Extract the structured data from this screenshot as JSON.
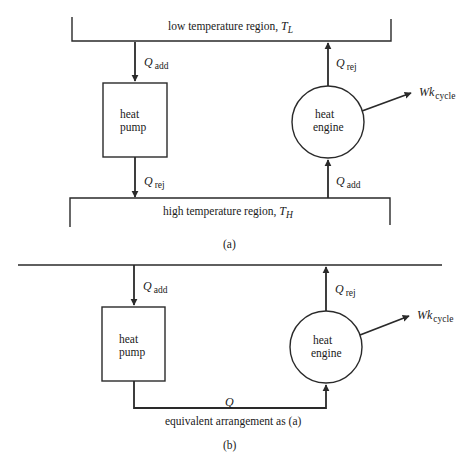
{
  "figure_a": {
    "low_region": {
      "text": "low temperature region, ",
      "symbol": "T",
      "subscript": "L"
    },
    "high_region": {
      "text": "high temperature region, ",
      "symbol": "T",
      "subscript": "H"
    },
    "heat_pump": {
      "line1": "heat",
      "line2": "pump"
    },
    "heat_engine": {
      "line1": "heat",
      "line2": "engine"
    },
    "pump_in": {
      "symbol": "Q",
      "subscript": "add"
    },
    "pump_out": {
      "symbol": "Q",
      "subscript": "rej"
    },
    "engine_out": {
      "symbol": "Q",
      "subscript": "rej"
    },
    "engine_in": {
      "symbol": "Q",
      "subscript": "add"
    },
    "work": {
      "symbol": "Wk",
      "subscript": "cycle"
    },
    "caption": "(a)"
  },
  "figure_b": {
    "heat_pump": {
      "line1": "heat",
      "line2": "pump"
    },
    "heat_engine": {
      "line1": "heat",
      "line2": "engine"
    },
    "pump_in": {
      "symbol": "Q",
      "subscript": "add"
    },
    "engine_out": {
      "symbol": "Q",
      "subscript": "rej"
    },
    "work": {
      "symbol": "Wk",
      "subscript": "cycle"
    },
    "transfer": {
      "symbol": "Q"
    },
    "note": "equivalent arrangement as (a)",
    "caption": "(b)"
  },
  "colors": {
    "stroke": "#2a2a2a",
    "text": "#1a1a1a",
    "background": "#ffffff"
  }
}
